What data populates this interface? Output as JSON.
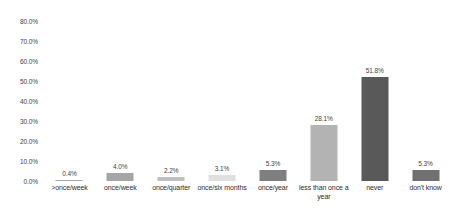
{
  "chart_data": {
    "type": "bar",
    "title": "",
    "subtitle": "",
    "xlabel": "",
    "ylabel": "",
    "ylim": [
      0,
      80
    ],
    "grid": false,
    "legend": false,
    "y_ticks": [
      "80.0%",
      "70.0%",
      "60.0%",
      "50.0%",
      "40.0%",
      "30.0%",
      "20.0%",
      "10.0%",
      "0.0%"
    ],
    "y_tick_values": [
      80,
      70,
      60,
      50,
      40,
      30,
      20,
      10,
      0
    ],
    "categories": [
      ">once/week",
      "once/week",
      "once/quarter",
      "once/six months",
      "once/year",
      "less than once a year",
      "never",
      "don't know"
    ],
    "values": [
      0.4,
      4.0,
      2.2,
      3.1,
      5.3,
      28.1,
      51.8,
      5.3
    ],
    "data_labels": [
      "0.4%",
      "4.0%",
      "2.2%",
      "3.1%",
      "5.3%",
      "28.1%",
      "51.8%",
      "5.3%"
    ],
    "bar_colors": [
      "#a6a6a6",
      "#a6a6a6",
      "#bfbfbf",
      "#e0e0e0",
      "#7f7f7f",
      "#b3b3b3",
      "#595959",
      "#707070"
    ],
    "background_color": "#ffffff",
    "text_color": "#3f3f3f"
  }
}
